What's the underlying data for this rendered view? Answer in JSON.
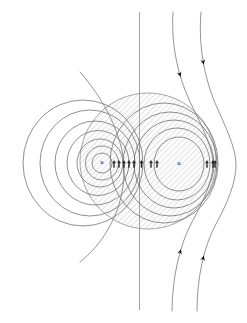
{
  "figure": {
    "width": 247,
    "height": 323,
    "background_color": "#ffffff"
  },
  "colors": {
    "contour_stroke": "#6b6b6b",
    "streamline_stroke": "#7a7a7a",
    "axis_stroke": "#9a9a9a",
    "hatch_stroke": "#c9c9c9",
    "hatch_fill": "#fbfbfb",
    "arrow_fill": "#111111",
    "marker_color": "#1a1a1a"
  },
  "axis": {
    "name": "vertical-symmetry-axis",
    "x": 139.5,
    "y_top": 12,
    "y_bottom": 310,
    "stroke_width": 0.9
  },
  "vortex_centers": [
    {
      "name": "left-vortex-center",
      "label": "×",
      "cx": 102,
      "cy": 163,
      "rotation": "counterclockwise"
    },
    {
      "name": "right-vortex-center",
      "label": "×",
      "cx": 179,
      "cy": 164,
      "rotation": "clockwise"
    }
  ],
  "separatrix_region": {
    "name": "hatched-separatrix-region",
    "description": "Shaded closed streamline region enclosing both vortices",
    "cx": 148,
    "cy": 161,
    "rx": 68,
    "ry": 68,
    "hatched": true
  },
  "left_contours": [
    {
      "cx": 102,
      "cy": 163,
      "rx": 10,
      "ry": 10
    },
    {
      "cx": 102,
      "cy": 163,
      "rx": 16.5,
      "ry": 17
    },
    {
      "cx": 100,
      "cy": 163,
      "rx": 23,
      "ry": 24
    },
    {
      "cx": 98,
      "cy": 163,
      "rx": 31,
      "ry": 32.5
    },
    {
      "cx": 95,
      "cy": 163,
      "rx": 40,
      "ry": 42
    },
    {
      "cx": 90,
      "cy": 163,
      "rx": 50,
      "ry": 53
    },
    {
      "cx": 83,
      "cy": 163,
      "rx": 60,
      "ry": 63
    }
  ],
  "right_contours": [
    {
      "cx": 179,
      "cy": 164,
      "rx": 25,
      "ry": 27
    },
    {
      "cx": 177,
      "cy": 164,
      "rx": 33,
      "ry": 36
    },
    {
      "cx": 174,
      "cy": 164,
      "rx": 40,
      "ry": 44
    },
    {
      "cx": 170,
      "cy": 164,
      "rx": 47,
      "ry": 52
    },
    {
      "cx": 164,
      "cy": 163,
      "rx": 54,
      "ry": 60
    }
  ],
  "midline_arrows": {
    "name": "midline-velocity-arrows",
    "direction": "up",
    "y": 164,
    "x_positions": [
      114,
      119,
      124,
      129,
      134,
      151,
      157,
      207,
      213
    ],
    "size": 7
  },
  "flank_arrows": [
    {
      "name": "left-flank-arrow",
      "x": 141.5,
      "y": 164,
      "direction": "up"
    },
    {
      "name": "right-flank-arrow",
      "x": 215,
      "y": 164,
      "direction": "up"
    }
  ],
  "streamlines": [
    {
      "name": "streamline-inner-left",
      "path": "M 80 72 C 96 90, 113 116, 121 146 C 127 170, 124 198, 112 222 C 102 242, 90 254, 80 262",
      "arrows": []
    },
    {
      "name": "streamline-outer-right-1",
      "path": "M 173 12 C 171 46, 178 78, 193 108 C 205 132, 213 150, 213 164 C 213 180, 204 200, 192 222 C 180 244, 172 278, 172 311",
      "arrows": [
        {
          "t": 0.21,
          "direction": "down"
        },
        {
          "t": 0.8,
          "direction": "up"
        }
      ]
    },
    {
      "name": "streamline-outer-right-2",
      "path": "M 201 12 C 198 48, 205 82, 219 112 C 230 136, 236 152, 236 165 C 236 182, 228 202, 216 224 C 203 248, 197 280, 197 311",
      "arrows": [
        {
          "t": 0.17,
          "direction": "down"
        },
        {
          "t": 0.82,
          "direction": "up"
        }
      ]
    }
  ]
}
